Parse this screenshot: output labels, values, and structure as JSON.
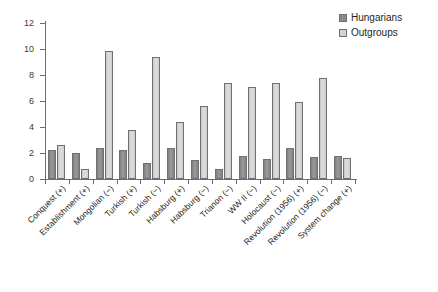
{
  "legend": {
    "position": "top-right",
    "entries": [
      {
        "label": "Hungarians",
        "color": "#8a8a8a",
        "name": "hungarians"
      },
      {
        "label": "Outgroups",
        "color": "#d2d2d2",
        "name": "outgroups"
      }
    ]
  },
  "axis": {
    "y_ticks": [
      "0",
      "2",
      "4",
      "6",
      "8",
      "10",
      "12"
    ]
  },
  "chart_data": {
    "type": "bar",
    "title": "",
    "subtitle": "",
    "xlabel": "",
    "ylabel": "",
    "ylim": [
      0,
      12
    ],
    "ytick_values": [
      0,
      2,
      4,
      6,
      8,
      10,
      12
    ],
    "grid": false,
    "legend_position": "top-right",
    "orientation": "vertical",
    "grouping": "grouped",
    "categories": [
      "Conquest (+)",
      "Establishment (+)",
      "Mongolian (−)",
      "Turkish (+)",
      "Turkish (−)",
      "Habsburg (+)",
      "Habsburg (−)",
      "Trianon (−)",
      "WW II (−)",
      "Holocaust (−)",
      "Revolution (1956) (+)",
      "Revolution (1956) (−)",
      "System change (+)"
    ],
    "series": [
      {
        "name": "Hungarians",
        "color": "#8a8a8a",
        "values": [
          2.2,
          2.0,
          2.35,
          2.25,
          1.2,
          2.4,
          1.5,
          0.75,
          1.75,
          1.55,
          2.35,
          1.7,
          1.8
        ]
      },
      {
        "name": "Outgroups",
        "color": "#d2d2d2",
        "values": [
          2.65,
          0.75,
          9.85,
          3.75,
          9.35,
          4.35,
          5.65,
          7.35,
          7.1,
          7.35,
          5.95,
          7.8,
          1.6
        ]
      }
    ]
  }
}
